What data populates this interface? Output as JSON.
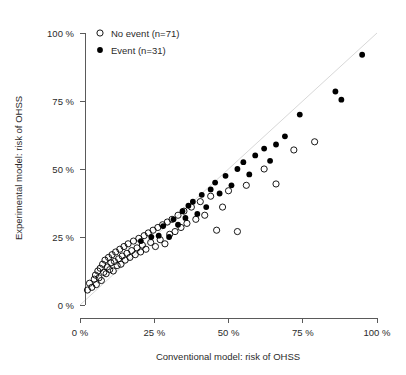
{
  "chart_data": {
    "type": "scatter",
    "title": "",
    "xlabel": "Conventional model: risk of OHSS",
    "ylabel": "Experimental model: risk of OHSS",
    "xlim": [
      0,
      100
    ],
    "ylim": [
      0,
      100
    ],
    "grid": false,
    "xticks": [
      0,
      25,
      50,
      75,
      100
    ],
    "yticks": [
      0,
      25,
      50,
      75,
      100
    ],
    "xticklabels": [
      "0 %",
      "25 %",
      "50 %",
      "75 %",
      "100 %"
    ],
    "yticklabels": [
      "0 %",
      "25 %",
      "50 %",
      "75 %",
      "100 %"
    ],
    "legend_position": "top-left",
    "annotations": [
      "identity line (y = x)"
    ],
    "series": [
      {
        "name": "No event (n=71)",
        "marker": "open-circle",
        "color": "#000000",
        "fill": "none",
        "n": 71,
        "points": [
          [
            2.5,
            5.5
          ],
          [
            3.2,
            8.0
          ],
          [
            4.0,
            6.5
          ],
          [
            4.8,
            9.5
          ],
          [
            5.2,
            11.0
          ],
          [
            5.5,
            7.5
          ],
          [
            6.0,
            12.5
          ],
          [
            6.4,
            10.0
          ],
          [
            6.8,
            13.5
          ],
          [
            7.2,
            9.0
          ],
          [
            7.6,
            15.0
          ],
          [
            8.0,
            12.0
          ],
          [
            8.4,
            16.5
          ],
          [
            8.8,
            11.5
          ],
          [
            9.2,
            14.0
          ],
          [
            9.6,
            17.5
          ],
          [
            10.0,
            13.0
          ],
          [
            10.4,
            15.5
          ],
          [
            10.8,
            18.5
          ],
          [
            11.2,
            12.5
          ],
          [
            11.6,
            16.0
          ],
          [
            12.0,
            19.5
          ],
          [
            12.5,
            14.5
          ],
          [
            13.0,
            17.0
          ],
          [
            13.4,
            20.5
          ],
          [
            13.8,
            15.0
          ],
          [
            14.2,
            18.0
          ],
          [
            14.8,
            21.5
          ],
          [
            15.2,
            16.5
          ],
          [
            15.8,
            19.0
          ],
          [
            16.2,
            22.5
          ],
          [
            16.8,
            17.5
          ],
          [
            17.4,
            20.0
          ],
          [
            18.0,
            23.5
          ],
          [
            18.6,
            18.5
          ],
          [
            19.2,
            21.0
          ],
          [
            19.8,
            24.5
          ],
          [
            20.4,
            19.5
          ],
          [
            21.0,
            22.0
          ],
          [
            21.6,
            25.5
          ],
          [
            22.2,
            20.5
          ],
          [
            23.0,
            26.5
          ],
          [
            23.8,
            23.0
          ],
          [
            24.6,
            27.5
          ],
          [
            25.4,
            21.5
          ],
          [
            26.2,
            28.5
          ],
          [
            27.0,
            24.0
          ],
          [
            27.8,
            29.5
          ],
          [
            28.6,
            22.5
          ],
          [
            29.4,
            30.5
          ],
          [
            30.2,
            26.0
          ],
          [
            31.0,
            31.5
          ],
          [
            32.0,
            27.0
          ],
          [
            33.0,
            33.0
          ],
          [
            34.0,
            28.5
          ],
          [
            35.0,
            34.5
          ],
          [
            36.0,
            30.0
          ],
          [
            37.5,
            36.0
          ],
          [
            39.0,
            31.5
          ],
          [
            40.5,
            38.0
          ],
          [
            42.0,
            33.0
          ],
          [
            44.0,
            40.0
          ],
          [
            46.0,
            27.5
          ],
          [
            48.0,
            36.0
          ],
          [
            50.0,
            42.0
          ],
          [
            53.0,
            27.0
          ],
          [
            56.0,
            44.0
          ],
          [
            62.0,
            50.0
          ],
          [
            66.0,
            44.5
          ],
          [
            72.0,
            57.0
          ],
          [
            79.0,
            60.0
          ]
        ]
      },
      {
        "name": "Event (n=31)",
        "marker": "filled-circle",
        "color": "#000000",
        "fill": "#000000",
        "n": 31,
        "points": [
          [
            20.5,
            23.5
          ],
          [
            24.0,
            25.0
          ],
          [
            26.5,
            25.5
          ],
          [
            28.0,
            29.0
          ],
          [
            30.0,
            25.0
          ],
          [
            31.5,
            31.5
          ],
          [
            33.0,
            29.5
          ],
          [
            34.5,
            34.5
          ],
          [
            35.5,
            32.0
          ],
          [
            36.5,
            36.5
          ],
          [
            38.0,
            38.0
          ],
          [
            39.5,
            33.5
          ],
          [
            41.0,
            40.5
          ],
          [
            42.5,
            36.0
          ],
          [
            44.0,
            42.5
          ],
          [
            45.5,
            45.0
          ],
          [
            47.0,
            41.0
          ],
          [
            49.0,
            47.5
          ],
          [
            51.0,
            44.0
          ],
          [
            53.0,
            50.0
          ],
          [
            55.0,
            52.5
          ],
          [
            57.0,
            48.0
          ],
          [
            59.0,
            55.0
          ],
          [
            62.0,
            57.5
          ],
          [
            64.0,
            53.0
          ],
          [
            66.0,
            59.0
          ],
          [
            69.0,
            62.0
          ],
          [
            74.0,
            70.0
          ],
          [
            86.0,
            78.5
          ],
          [
            88.0,
            75.5
          ],
          [
            95.0,
            92.0
          ]
        ]
      }
    ]
  },
  "legend": {
    "items": [
      {
        "label": "No event (n=71)",
        "marker": "open-circle"
      },
      {
        "label": "Event (n=31)",
        "marker": "filled-circle"
      }
    ]
  },
  "axes": {
    "x_title": "Conventional model: risk of OHSS",
    "y_title": "Experimental model: risk of OHSS",
    "x_labels": [
      "0 %",
      "25 %",
      "50 %",
      "75 %",
      "100 %"
    ],
    "y_labels": [
      "0 %",
      "25 %",
      "50 %",
      "75 %",
      "100 %"
    ]
  },
  "colors": {
    "marker": "#000000",
    "axis": "#5a5a5a",
    "identity_line": "#d8d8d8",
    "background": "#ffffff"
  }
}
